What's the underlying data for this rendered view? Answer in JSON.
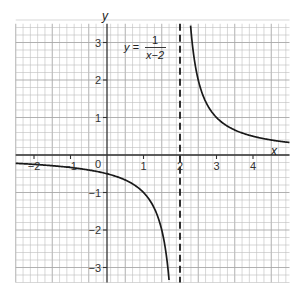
{
  "chart_data": {
    "type": "line",
    "title": "",
    "equation": {
      "lhs": "y =",
      "numerator": "1",
      "denominator": "x−2"
    },
    "xlabel": "x",
    "ylabel": "y",
    "xlim": [
      -2.5,
      5.0
    ],
    "ylim": [
      -3.4,
      3.5
    ],
    "x_ticks": [
      -2,
      -1,
      1,
      2,
      3,
      4
    ],
    "x_tick_labels": [
      "−2",
      "−1",
      "1",
      "2",
      "3",
      "4"
    ],
    "y_ticks": [
      -3,
      -2,
      -1,
      1,
      2,
      3
    ],
    "y_tick_labels": [
      "−3",
      "−2",
      "−1",
      "1",
      "2",
      "3"
    ],
    "origin_label": "0",
    "grid": true,
    "grid_minor_step": 0.2,
    "asymptote": {
      "type": "vertical",
      "x": 2,
      "style": "dashed"
    },
    "series": [
      {
        "name": "y = 1/(x-2), x < 2",
        "x": [
          -2.5,
          -2,
          -1,
          0,
          0.5,
          1,
          1.5,
          1.7
        ],
        "values": [
          -0.22,
          -0.25,
          -0.33,
          -0.5,
          -0.67,
          -1,
          -2,
          -3.33
        ]
      },
      {
        "name": "y = 1/(x-2), x > 2",
        "x": [
          2.29,
          2.5,
          3,
          3.5,
          4,
          5
        ],
        "values": [
          3.45,
          2,
          1,
          0.67,
          0.5,
          0.33
        ]
      }
    ],
    "colors": {
      "curve": "#1a1a1a",
      "axis": "#333333",
      "grid": "#bdbdbd",
      "asymptote": "#1a1a1a"
    }
  }
}
